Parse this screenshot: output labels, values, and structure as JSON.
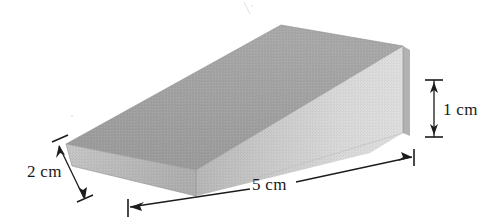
{
  "figure": {
    "name": "wedge-solid-diagram",
    "background_color": "#ffffff",
    "solid": {
      "name": "wedge",
      "top_face_color": "#9d9d9d",
      "front_face_color": "#d4d4d4",
      "end_face_color": "#b9b9b9",
      "outline_color": "#8a8a8a"
    },
    "dimensions": [
      {
        "id": "height",
        "label": "1 cm",
        "value": 1,
        "unit": "cm",
        "orientation": "vertical",
        "arrow": "double-headed",
        "position": "right"
      },
      {
        "id": "width",
        "label": "2 cm",
        "value": 2,
        "unit": "cm",
        "orientation": "diagonal",
        "arrow": "double-headed",
        "position": "left"
      },
      {
        "id": "length",
        "label": "5 cm",
        "value": 5,
        "unit": "cm",
        "orientation": "diagonal",
        "arrow": "double-headed",
        "position": "bottom"
      }
    ]
  }
}
